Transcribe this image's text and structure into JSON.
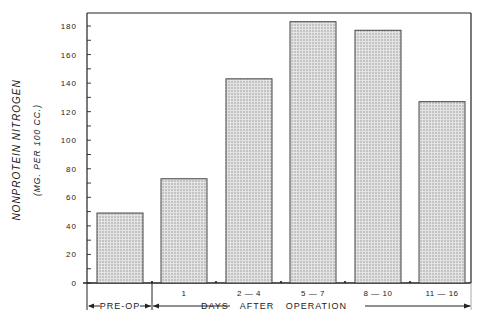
{
  "chart_data": {
    "type": "bar",
    "title": "",
    "ylabel": "NONPROTEIN NITROGEN",
    "ylabel_sub": "(MG. PER 100 CC.)",
    "xlabel": "DAYS AFTER OPERATION",
    "categories": [
      "PRE-OP",
      "1",
      "2 — 4",
      "5 — 7",
      "8 — 10",
      "11 — 16"
    ],
    "category_labels_on_axis": [
      "",
      "1",
      "2 — 4",
      "5 — 7",
      "8 — 10",
      "11 — 16"
    ],
    "values": [
      49,
      73,
      143,
      183,
      177,
      127
    ],
    "ylim": [
      0,
      190
    ],
    "yticks": [
      0,
      20,
      40,
      60,
      80,
      100,
      120,
      140,
      160,
      180
    ],
    "minor_tick_step": 10,
    "grid": false,
    "legend": null,
    "bar_fill": "stippled gray",
    "ranges": [
      {
        "label": "PRE-OP",
        "from_category": 0,
        "to_category": 0
      },
      {
        "label": "DAYS AFTER OPERATION",
        "from_category": 1,
        "to_category": 5
      }
    ]
  },
  "colors": {
    "ink": "#222222",
    "bar_fill": "#d9d9d9",
    "bar_dot": "#8a8a8a",
    "background": "#ffffff"
  }
}
